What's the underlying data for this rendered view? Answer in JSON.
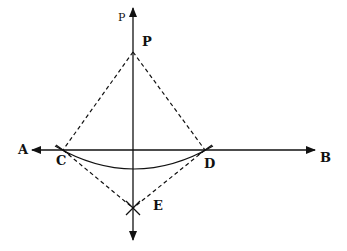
{
  "diagram": {
    "colors": {
      "ink": "#111111",
      "background": "#ffffff"
    },
    "labels": {
      "axis_top": "P",
      "point_P": "P",
      "left_end": "A",
      "right_end": "B",
      "point_C": "C",
      "point_D": "D",
      "point_E": "E"
    },
    "points": {
      "P": [
        133,
        52
      ],
      "C": [
        63,
        150
      ],
      "D": [
        205,
        150
      ],
      "E": [
        133,
        208
      ]
    },
    "lines": [
      {
        "name": "AB",
        "from": [
          30,
          150
        ],
        "to": [
          315,
          150
        ],
        "style": "solid",
        "arrows": "both"
      },
      {
        "name": "perpendicular",
        "from": [
          133,
          8
        ],
        "to": [
          133,
          240
        ],
        "style": "solid",
        "arrows": "both"
      },
      {
        "name": "PC",
        "style": "dashed"
      },
      {
        "name": "PD",
        "style": "dashed"
      },
      {
        "name": "CE",
        "style": "dashed"
      },
      {
        "name": "DE",
        "style": "dashed"
      }
    ],
    "arcs": [
      {
        "name": "arc-CD",
        "center": "P",
        "sag_y": 168
      }
    ]
  }
}
